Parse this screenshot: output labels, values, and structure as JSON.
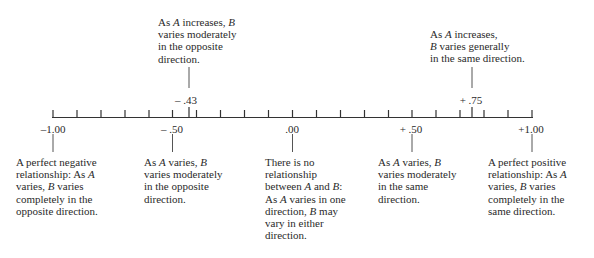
{
  "chart_data": {
    "type": "number-line",
    "title": "",
    "axis": {
      "min": -1.0,
      "max": 1.0,
      "minor_step": 0.1,
      "labeled_ticks": [
        "-1.00",
        "- .50",
        ".00",
        "+ .50",
        "+1.00"
      ]
    },
    "markers": [
      {
        "value": -0.43,
        "label": "– .43",
        "position": "above",
        "text": "As A increases, B varies moderately in the opposite direction."
      },
      {
        "value": 0.75,
        "label": "+ .75",
        "position": "above",
        "text": "As A increases, B varies generally in the same direction."
      }
    ],
    "annotations": [
      {
        "value": -1.0,
        "label": "–1.00",
        "text": "A perfect negative relationship: As A varies, B varies completely in the opposite direction."
      },
      {
        "value": -0.5,
        "label": "– .50",
        "text": "As A varies, B varies moderately in the opposite direction."
      },
      {
        "value": 0.0,
        "label": ".00",
        "text": "There is no relationship between A and B: As A varies in one direction, B may vary in either direction."
      },
      {
        "value": 0.5,
        "label": "+ .50",
        "text": "As A varies, B varies moderately in the same direction."
      },
      {
        "value": 1.0,
        "label": "+1.00",
        "text": "A perfect positive relationship: As A varies, B varies completely in the same direction."
      }
    ]
  },
  "top": {
    "neg43": {
      "value_label": "– .43",
      "lines": [
        [
          {
            "t": "As "
          },
          {
            "t": "A",
            "i": true
          },
          {
            "t": " increases, "
          },
          {
            "t": "B",
            "i": true
          }
        ],
        [
          {
            "t": "varies moderately"
          }
        ],
        [
          {
            "t": "in the opposite"
          }
        ],
        [
          {
            "t": "direction."
          }
        ]
      ]
    },
    "pos75": {
      "value_label": "+ .75",
      "lines": [
        [
          {
            "t": "As "
          },
          {
            "t": "A",
            "i": true
          },
          {
            "t": " increases,"
          }
        ],
        [
          {
            "t": "B",
            "i": true
          },
          {
            "t": " varies generally"
          }
        ],
        [
          {
            "t": "in the same direction."
          }
        ]
      ]
    }
  },
  "ticks": {
    "m100": "–1.00",
    "m50": "– .50",
    "z00": ".00",
    "p50": "+ .50",
    "p100": "+1.00"
  },
  "bottom": {
    "m100": {
      "lines": [
        [
          {
            "t": "A perfect negative"
          }
        ],
        [
          {
            "t": "relationship: As "
          },
          {
            "t": "A",
            "i": true
          }
        ],
        [
          {
            "t": "varies, "
          },
          {
            "t": "B",
            "i": true
          },
          {
            "t": " varies"
          }
        ],
        [
          {
            "t": "completely in the"
          }
        ],
        [
          {
            "t": "opposite direction."
          }
        ]
      ]
    },
    "m50": {
      "lines": [
        [
          {
            "t": "As "
          },
          {
            "t": "A",
            "i": true
          },
          {
            "t": " varies, "
          },
          {
            "t": "B",
            "i": true
          }
        ],
        [
          {
            "t": "varies moderately"
          }
        ],
        [
          {
            "t": "in the opposite"
          }
        ],
        [
          {
            "t": "direction."
          }
        ]
      ]
    },
    "z00": {
      "lines": [
        [
          {
            "t": "There is no"
          }
        ],
        [
          {
            "t": "relationship"
          }
        ],
        [
          {
            "t": "between "
          },
          {
            "t": "A",
            "i": true
          },
          {
            "t": " and "
          },
          {
            "t": "B",
            "i": true
          },
          {
            "t": ":"
          }
        ],
        [
          {
            "t": "As "
          },
          {
            "t": "A",
            "i": true
          },
          {
            "t": " varies in one"
          }
        ],
        [
          {
            "t": "direction, "
          },
          {
            "t": "B",
            "i": true
          },
          {
            "t": " may"
          }
        ],
        [
          {
            "t": "vary in either"
          }
        ],
        [
          {
            "t": "direction."
          }
        ]
      ]
    },
    "p50": {
      "lines": [
        [
          {
            "t": "As "
          },
          {
            "t": "A",
            "i": true
          },
          {
            "t": " varies, "
          },
          {
            "t": "B",
            "i": true
          }
        ],
        [
          {
            "t": "varies moderately"
          }
        ],
        [
          {
            "t": "in the same"
          }
        ],
        [
          {
            "t": "direction."
          }
        ]
      ]
    },
    "p100": {
      "lines": [
        [
          {
            "t": "A perfect positive"
          }
        ],
        [
          {
            "t": "relationship: As "
          },
          {
            "t": "A",
            "i": true
          }
        ],
        [
          {
            "t": "varies, "
          },
          {
            "t": "B",
            "i": true
          },
          {
            "t": " varies"
          }
        ],
        [
          {
            "t": "completely in the"
          }
        ],
        [
          {
            "t": "same direction."
          }
        ]
      ]
    }
  },
  "colors": {
    "ink": "#2a2a2a",
    "line": "#333333",
    "background": "#ffffff"
  }
}
